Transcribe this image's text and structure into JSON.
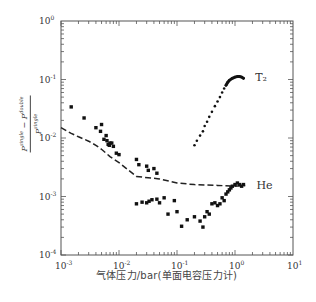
{
  "chart_data": {
    "type": "scatter",
    "title": "",
    "xlabel": "气体压力/bar(单面电容压力计)",
    "ylabel": "(P^single − P^double) / P^single",
    "ylabel_parts": {
      "numerator": "P",
      "num_sup1": "single",
      "minus": "−",
      "num_p2": "P",
      "num_sup2": "double",
      "denominator": "P",
      "den_sup": "single"
    },
    "xscale": "log",
    "yscale": "log",
    "xlim": [
      0.001,
      10
    ],
    "ylim": [
      0.0001,
      1
    ],
    "grid": false,
    "x_ticks": [
      {
        "base": "10",
        "exp": "-3",
        "value": 0.001
      },
      {
        "base": "10",
        "exp": "-2",
        "value": 0.01
      },
      {
        "base": "10",
        "exp": "-1",
        "value": 0.1
      },
      {
        "base": "10",
        "exp": "0",
        "value": 1
      },
      {
        "base": "10",
        "exp": "1",
        "value": 10
      }
    ],
    "y_ticks": [
      {
        "base": "10",
        "exp": "0",
        "value": 1
      },
      {
        "base": "10",
        "exp": "-1",
        "value": 0.1
      },
      {
        "base": "10",
        "exp": "-2",
        "value": 0.01
      },
      {
        "base": "10",
        "exp": "-3",
        "value": 0.001
      },
      {
        "base": "10",
        "exp": "-4",
        "value": 0.0001
      }
    ],
    "annotations": [
      {
        "text": "T₂",
        "x": 1.9,
        "y": 0.11
      },
      {
        "text": "He",
        "x": 2.0,
        "y": 0.0016
      }
    ],
    "series": [
      {
        "name": "He (dashed)",
        "style": "dashed-line",
        "x": [
          0.001,
          0.0015,
          0.002,
          0.003,
          0.004,
          0.005,
          0.007,
          0.01,
          0.02,
          0.05,
          0.1,
          0.2,
          0.5,
          1.0,
          1.5
        ],
        "y": [
          0.015,
          0.012,
          0.0105,
          0.0088,
          0.0075,
          0.0064,
          0.0048,
          0.0038,
          0.0022,
          0.002,
          0.0017,
          0.0016,
          0.00155,
          0.0015,
          0.00155
        ]
      },
      {
        "name": "T₂ (dots)",
        "style": "small-dots",
        "x": [
          0.2,
          0.22,
          0.25,
          0.28,
          0.3,
          0.33,
          0.36,
          0.4,
          0.45,
          0.5,
          0.55,
          0.6,
          0.65,
          0.7,
          0.75,
          0.8,
          0.9,
          1.0,
          1.1,
          1.2,
          1.3,
          1.4
        ],
        "y": [
          0.0075,
          0.009,
          0.011,
          0.013,
          0.016,
          0.019,
          0.023,
          0.028,
          0.035,
          0.042,
          0.05,
          0.06,
          0.07,
          0.08,
          0.09,
          0.097,
          0.105,
          0.11,
          0.112,
          0.112,
          0.11,
          0.105
        ]
      },
      {
        "name": "T₂ (squares, low pressure)",
        "style": "squares",
        "x": [
          0.0015,
          0.0025,
          0.004,
          0.0048,
          0.005,
          0.0055,
          0.006,
          0.0062,
          0.0065,
          0.0068,
          0.007,
          0.0075,
          0.008,
          0.009,
          0.01,
          0.02,
          0.022,
          0.03,
          0.032,
          0.04,
          0.045
        ],
        "y": [
          0.034,
          0.022,
          0.015,
          0.013,
          0.017,
          0.0095,
          0.011,
          0.009,
          0.0078,
          0.0075,
          0.0082,
          0.0082,
          0.0072,
          0.0055,
          0.0052,
          0.0043,
          0.0035,
          0.0033,
          0.0028,
          0.003,
          0.0025
        ]
      },
      {
        "name": "He (squares)",
        "style": "squares",
        "x": [
          0.02,
          0.025,
          0.03,
          0.033,
          0.037,
          0.045,
          0.05,
          0.06,
          0.07,
          0.09,
          0.1,
          0.12,
          0.15,
          0.2,
          0.25,
          0.28,
          0.3,
          0.33,
          0.36,
          0.4,
          0.45,
          0.5,
          0.55,
          0.6,
          0.65,
          0.7,
          0.75,
          0.8,
          0.85,
          0.9,
          1.0,
          1.1,
          1.2,
          1.3,
          1.4
        ],
        "y": [
          0.00075,
          0.0008,
          0.00078,
          0.00083,
          0.00088,
          0.0009,
          0.00078,
          0.00095,
          0.0005,
          0.00085,
          0.00055,
          0.00031,
          0.0004,
          0.00045,
          0.00038,
          0.0003,
          0.00045,
          0.00055,
          0.0005,
          0.00075,
          0.00078,
          0.0007,
          0.00075,
          0.00095,
          0.00085,
          0.0011,
          0.0012,
          0.0013,
          0.0014,
          0.0015,
          0.0016,
          0.0017,
          0.0016,
          0.0015,
          0.0016
        ]
      }
    ]
  }
}
